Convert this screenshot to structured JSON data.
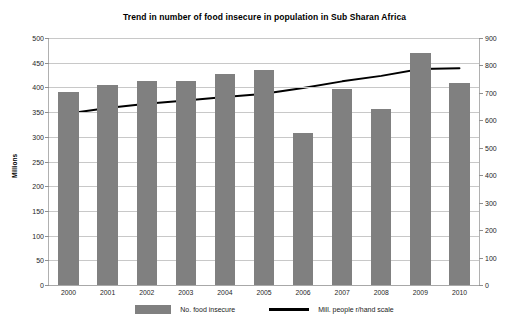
{
  "chart_data": {
    "type": "bar",
    "title": "Trend in number of food insecure in population in Sub Sharan Africa",
    "xlabel": "",
    "ylabel": "Millions",
    "categories": [
      "2000",
      "2001",
      "2002",
      "2003",
      "2004",
      "2005",
      "2006",
      "2007",
      "2008",
      "2009",
      "2010"
    ],
    "series": [
      {
        "name": "No. food insecure",
        "type": "bar",
        "axis": "left",
        "color": "#808080",
        "values": [
          390,
          405,
          412,
          413,
          427,
          436,
          307,
          396,
          357,
          470,
          409
        ]
      },
      {
        "name": "Mill. people r/hand scale",
        "type": "line",
        "axis": "right",
        "color": "#000000",
        "values": [
          625,
          645,
          660,
          672,
          685,
          697,
          718,
          742,
          762,
          787,
          790
        ]
      }
    ],
    "ylim": [
      0,
      500
    ],
    "y2lim": [
      0,
      900
    ],
    "yticks": [
      0,
      50,
      100,
      150,
      200,
      250,
      300,
      350,
      400,
      450,
      500
    ],
    "y2ticks": [
      0,
      100,
      200,
      300,
      400,
      500,
      600,
      700,
      800,
      900
    ],
    "grid": true,
    "legend_position": "bottom"
  },
  "legend": {
    "bar_label": "No. food insecure",
    "line_label": "Mill. people r/hand scale"
  }
}
